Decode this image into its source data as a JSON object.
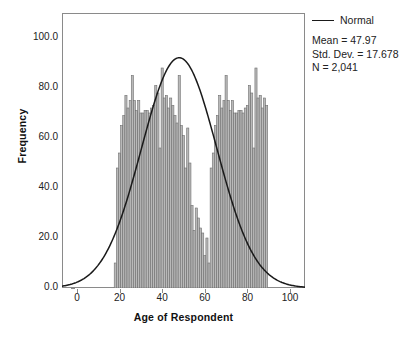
{
  "chart_data": {
    "type": "bar",
    "title": "",
    "subtitle": "",
    "xlabel": "Age of Respondent",
    "ylabel": "Frequency",
    "xlim": [
      -7,
      107
    ],
    "ylim": [
      0,
      110
    ],
    "xticks": [
      "0",
      "20",
      "40",
      "60",
      "80",
      "100"
    ],
    "xtick_values": [
      0,
      20,
      40,
      60,
      80,
      100
    ],
    "yticks": [
      "0.0",
      "20.0",
      "40.0",
      "60.0",
      "80.0",
      "100.0"
    ],
    "ytick_values": [
      0,
      20,
      40,
      60,
      80,
      100
    ],
    "grid": false,
    "bin_width": 1,
    "bar_color": "#b9b9b9",
    "bar_edge_color": "#6e6e6e",
    "categories": [
      18,
      19,
      20,
      21,
      22,
      23,
      24,
      25,
      26,
      27,
      28,
      29,
      30,
      31,
      32,
      33,
      34,
      35,
      36,
      37,
      38,
      39,
      40,
      41,
      42,
      43,
      44,
      45,
      46,
      47,
      48,
      49,
      50,
      51,
      52,
      53,
      54,
      55,
      56,
      57,
      58,
      59,
      60,
      61,
      62,
      63,
      64,
      65,
      66,
      67,
      68,
      69,
      70,
      71,
      72,
      73,
      74,
      75,
      76,
      77,
      78,
      79,
      80,
      81,
      82,
      83,
      84,
      85,
      86,
      87,
      88,
      89
    ],
    "values": [
      10,
      48,
      54,
      65,
      69,
      77,
      72,
      75,
      85,
      75,
      71,
      75,
      70,
      70,
      71,
      71,
      70,
      72,
      73,
      81,
      78,
      56,
      88,
      76,
      77,
      72,
      76,
      73,
      69,
      66,
      85,
      65,
      61,
      48,
      64,
      50,
      33,
      23,
      32,
      28,
      24,
      22,
      13,
      20,
      10,
      48,
      54,
      65,
      69,
      77,
      72,
      75,
      85,
      75,
      71,
      75,
      70,
      70,
      71,
      71,
      70,
      72,
      73,
      81,
      78,
      56,
      88,
      76,
      77,
      72,
      76,
      73
    ],
    "overlay": {
      "type": "line",
      "name": "Normal",
      "color": "#1a1a1a",
      "mean": 47.97,
      "std_dev": 17.678,
      "n": 2041,
      "peak_value": 92.1
    },
    "annotations": [
      "Mean = 47.97",
      "Std. Dev. = 17.678",
      "N = 2,041"
    ]
  },
  "legend": {
    "series_label": "Normal",
    "swatch": "line-swatch",
    "stats": [
      "Mean = 47.97",
      "Std. Dev. = 17.678",
      "N = 2,041"
    ]
  },
  "axes": {
    "x_title": "Age of Respondent",
    "y_title": "Frequency"
  }
}
